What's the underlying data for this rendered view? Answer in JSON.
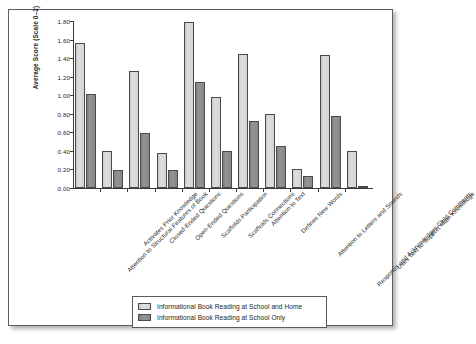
{
  "chart_data": {
    "type": "bar",
    "title": "",
    "xlabel": "",
    "ylabel": "Average Score (Scale 0–2)",
    "ylim": [
      0,
      1.8
    ],
    "ytick_labels": [
      "0.00",
      "0.20",
      "0.40",
      "0.60",
      "0.80",
      "1.00",
      "1.20",
      "1.40",
      "1.60",
      "1.80"
    ],
    "ytick_values": [
      0,
      0.2,
      0.4,
      0.6,
      0.8,
      1.0,
      1.2,
      1.4,
      1.6,
      1.8
    ],
    "grid": false,
    "legend_position": "bottom-center",
    "categories": [
      "Attention to Structural Features of Book",
      "Activates Prior Knowledge",
      "Closed-Ended Questions",
      "Open-Ended Questions",
      "Scaffolds Participation",
      "Scaffolds Connections",
      "Attention to Text",
      "Defines New Words",
      "Attention to Letters and Sounds",
      "Responds and Acknowledges Child Comments",
      "Uses Text to Support Main Knowledge"
    ],
    "series": [
      {
        "name": "Informational Book Reading at School and Home",
        "color": "#d4d4d4",
        "values": [
          1.56,
          0.4,
          1.26,
          0.38,
          1.79,
          0.98,
          1.44,
          0.8,
          0.2,
          1.43,
          0.4
        ]
      },
      {
        "name": "Informational Book Reading at School Only",
        "color": "#8a8a8a",
        "values": [
          1.01,
          0.19,
          0.59,
          0.19,
          1.14,
          0.4,
          0.72,
          0.45,
          0.13,
          0.78,
          0.02
        ]
      }
    ]
  },
  "legend": {
    "entries": [
      {
        "label": "Informational Book Reading at School and Home",
        "swatch": "light"
      },
      {
        "label": "Informational Book Reading at School Only",
        "swatch": "dark"
      }
    ]
  }
}
